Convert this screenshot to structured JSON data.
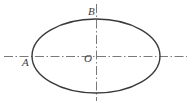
{
  "figure": {
    "type": "geometry-diagram",
    "background_color": "#ffffff",
    "stroke_color": "#3a3a3a",
    "axis_color": "#7a7a7a",
    "labels": {
      "A": "A",
      "B": "B",
      "O": "O"
    },
    "points": [
      {
        "name": "A",
        "label": "A",
        "role": "left-vertex",
        "x": 32,
        "y": 56
      },
      {
        "name": "B",
        "label": "B",
        "role": "top-vertex",
        "x": 96,
        "y": 19
      },
      {
        "name": "O",
        "label": "O",
        "role": "center",
        "x": 96,
        "y": 56
      }
    ],
    "ellipse": {
      "center_x": 96,
      "center_y": 56,
      "radius_x": 64,
      "radius_y": 37,
      "stroke_width": 1.4
    },
    "axes": [
      {
        "name": "horizontal-axis",
        "orientation": "horizontal",
        "x1": 4,
        "y1": 56,
        "x2": 187,
        "y2": 56,
        "dash": "dash-dot"
      },
      {
        "name": "vertical-axis",
        "orientation": "vertical",
        "x1": 96,
        "y1": 4,
        "x2": 96,
        "y2": 101,
        "dash": "dash-dot"
      }
    ]
  }
}
